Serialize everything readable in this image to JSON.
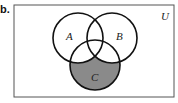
{
  "problem_label": "b.",
  "diagram": {
    "type": "venn",
    "universe_label": "U",
    "sets": [
      {
        "name": "A",
        "label": "A"
      },
      {
        "name": "B",
        "label": "B"
      },
      {
        "name": "C",
        "label": "C"
      }
    ],
    "shaded_region": "C − (A ∪ B)",
    "colors": {
      "stroke": "#111111",
      "shade": "#8a8a8a",
      "background": "#ffffff"
    }
  }
}
